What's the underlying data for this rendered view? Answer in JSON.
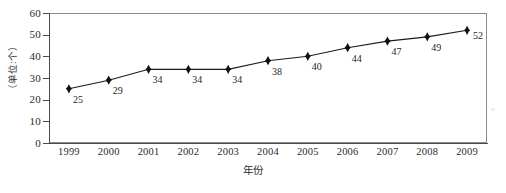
{
  "chart_data": {
    "type": "line",
    "title": "",
    "subtitle": "",
    "xlabel": "年份",
    "ylabel": "（单位:个）",
    "categories": [
      "1999",
      "2000",
      "2001",
      "2002",
      "2003",
      "2004",
      "2005",
      "2006",
      "2007",
      "2008",
      "2009"
    ],
    "values": [
      25,
      29,
      34,
      34,
      34,
      38,
      40,
      44,
      47,
      49,
      52
    ],
    "point_labels": [
      "25",
      "29",
      "34",
      "34",
      "34",
      "38",
      "40",
      "44",
      "47",
      "49",
      "52"
    ],
    "series": [
      {
        "name": "",
        "values": [
          25,
          29,
          34,
          34,
          34,
          38,
          40,
          44,
          47,
          49,
          52
        ],
        "marker": "diamond",
        "line_color": "#1a1a1a",
        "marker_color": "#111111"
      }
    ],
    "ylim": [
      0,
      60
    ],
    "ytick_values": [
      0,
      10,
      20,
      30,
      40,
      50,
      60
    ],
    "ytick_labels": [
      "0",
      "10",
      "20",
      "30",
      "40",
      "50",
      "60"
    ],
    "xtick_labels": [
      "1999",
      "2000",
      "2001",
      "2002",
      "2003",
      "2004",
      "2005",
      "2006",
      "2007",
      "2008",
      "2009"
    ],
    "grid": false,
    "legend": false,
    "legend_position": "none",
    "frame_color": "#8c8c8c",
    "axis_color": "#4a4a4a",
    "background_color": "#ffffff",
    "annotations": []
  },
  "figure": {
    "artifact_text": "≡"
  }
}
